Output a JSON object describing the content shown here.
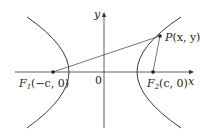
{
  "diagram": {
    "type": "hyperbola-foci",
    "axes": {
      "x_label": "x",
      "y_label": "y",
      "origin_label": "0"
    },
    "points": {
      "F1": {
        "name": "F",
        "sub": "1",
        "coords": "(−c, 0)"
      },
      "F2": {
        "name": "F",
        "sub": "2",
        "coords": "(c, 0)"
      },
      "P": {
        "name": "P",
        "coords": "(x, y)"
      }
    },
    "segments": [
      "F1-P",
      "F2-P"
    ],
    "colors": {
      "stroke": "#3a3a3a",
      "text": "#231f20",
      "background": "#ffffff"
    }
  }
}
